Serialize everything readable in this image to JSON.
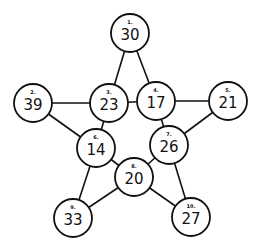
{
  "diagram": {
    "type": "pentagram-number-graph",
    "nodes": [
      {
        "id": 1,
        "label": "1.",
        "value": "30",
        "x": 130,
        "y": 33
      },
      {
        "id": 2,
        "label": "2.",
        "value": "39",
        "x": 33,
        "y": 103
      },
      {
        "id": 3,
        "label": "3.",
        "value": "23",
        "x": 109,
        "y": 103
      },
      {
        "id": 4,
        "label": "4.",
        "value": "17",
        "x": 156,
        "y": 101
      },
      {
        "id": 5,
        "label": "5.",
        "value": "21",
        "x": 228,
        "y": 101
      },
      {
        "id": 6,
        "label": "6.",
        "value": "14",
        "x": 96,
        "y": 148
      },
      {
        "id": 7,
        "label": "7.",
        "value": "26",
        "x": 169,
        "y": 145
      },
      {
        "id": 8,
        "label": "8.",
        "value": "20",
        "x": 134,
        "y": 177
      },
      {
        "id": 9,
        "label": "9.",
        "value": "33",
        "x": 73,
        "y": 218
      },
      {
        "id": 10,
        "label": "10.",
        "value": "27",
        "x": 191,
        "y": 217
      }
    ],
    "edges": [
      [
        1,
        3
      ],
      [
        1,
        4
      ],
      [
        2,
        3
      ],
      [
        3,
        4
      ],
      [
        4,
        5
      ],
      [
        2,
        6
      ],
      [
        3,
        6
      ],
      [
        4,
        7
      ],
      [
        5,
        7
      ],
      [
        6,
        8
      ],
      [
        7,
        8
      ],
      [
        6,
        9
      ],
      [
        8,
        9
      ],
      [
        7,
        10
      ],
      [
        8,
        10
      ]
    ],
    "node_radius": 19,
    "colors": {
      "stroke": "#111111",
      "fill": "#ffffff"
    }
  }
}
